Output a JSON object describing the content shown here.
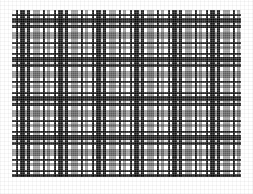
{
  "page": {
    "background": "#ffffff",
    "width": 253,
    "height": 194
  },
  "swatch": {
    "label": "tartan-fabric-swatch",
    "x": 12,
    "y": 10,
    "width": 229,
    "height": 167,
    "background": "#ffffff",
    "description": "Grayscale woven tartan / plaid textile sample, halftone print"
  },
  "palette": {
    "white": "#ffffff",
    "light_gray": "#d9d9d9",
    "mid_gray": "#9a9a9a",
    "dark_gray": "#5a5a5a",
    "black": "#1c1c1c",
    "paper": "#ffffff"
  },
  "chart_data": {
    "type": "heatmap",
    "xlabel": "",
    "ylabel": "",
    "warp_repeat_px": 38,
    "weft_repeat_px": 39,
    "warp_sett": [
      {
        "tone": "white",
        "width": 4
      },
      {
        "tone": "black",
        "width": 2
      },
      {
        "tone": "white",
        "width": 2
      },
      {
        "tone": "black",
        "width": 5
      },
      {
        "tone": "light_gray",
        "width": 2
      },
      {
        "tone": "black",
        "width": 3
      },
      {
        "tone": "white",
        "width": 3
      },
      {
        "tone": "mid_gray",
        "width": 7
      },
      {
        "tone": "white",
        "width": 3
      },
      {
        "tone": "black",
        "width": 2
      },
      {
        "tone": "white",
        "width": 2
      },
      {
        "tone": "mid_gray",
        "width": 3
      }
    ],
    "weft_sett": [
      {
        "tone": "white",
        "height": 4
      },
      {
        "tone": "black",
        "height": 2
      },
      {
        "tone": "white",
        "height": 2
      },
      {
        "tone": "black",
        "height": 5
      },
      {
        "tone": "light_gray",
        "height": 2
      },
      {
        "tone": "black",
        "height": 3
      },
      {
        "tone": "white",
        "height": 4
      },
      {
        "tone": "mid_gray",
        "height": 7
      },
      {
        "tone": "white",
        "height": 3
      },
      {
        "tone": "black",
        "height": 2
      },
      {
        "tone": "white",
        "height": 2
      },
      {
        "tone": "mid_gray",
        "height": 3
      }
    ]
  }
}
